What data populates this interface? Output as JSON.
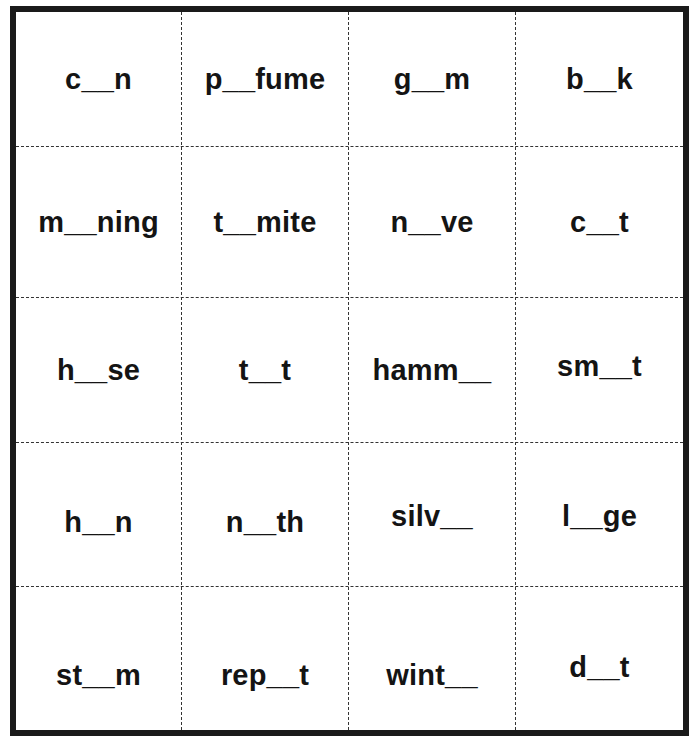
{
  "worksheet": {
    "columns": 4,
    "rows": 5,
    "cards": [
      [
        "c__n",
        "p__fume",
        "g__m",
        "b__k"
      ],
      [
        "m__ning",
        "t__mite",
        "n__ve",
        "c__t"
      ],
      [
        "h__se",
        "t__t",
        "hamm__",
        "sm__t"
      ],
      [
        "h__n",
        "n__th",
        "silv__",
        "l__ge"
      ],
      [
        "st__m",
        "rep__t",
        "wint__",
        "d__t"
      ]
    ]
  }
}
